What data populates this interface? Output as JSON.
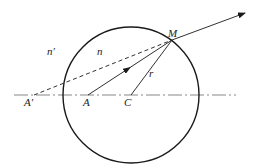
{
  "diagram": {
    "type": "optics-refraction-spherical-surface",
    "colors": {
      "stroke": "#1a1a1a",
      "axis": "#888888",
      "background": "#ffffff"
    },
    "labels": {
      "n_prime": "n′",
      "n": "n",
      "M": "M",
      "r": "r",
      "A": "A",
      "C": "C",
      "A_prime": "A′"
    },
    "elements": {
      "circle": {
        "cx": 131,
        "cy": 95,
        "r": 68
      },
      "axis": {
        "x1": 14,
        "x2": 236,
        "y": 95,
        "style": "dash-dot"
      },
      "points": {
        "A": [
          88,
          95
        ],
        "C": [
          131,
          95
        ],
        "A_prime": [
          34,
          95
        ],
        "M": [
          172,
          40
        ]
      },
      "incident_ray": {
        "from": "A",
        "to": "M",
        "style": "solid",
        "arrow": "middle"
      },
      "radius": {
        "from": "C",
        "to": "M",
        "style": "solid"
      },
      "virtual_ray": {
        "from": "A_prime",
        "to": "M",
        "style": "dashed"
      },
      "refracted_ray": {
        "from": "M",
        "to": [
          245,
          13
        ],
        "style": "solid",
        "arrow": "end"
      }
    }
  }
}
